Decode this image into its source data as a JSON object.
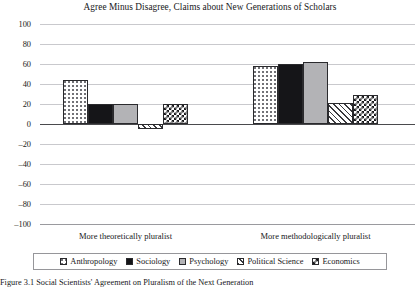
{
  "chart_data": {
    "type": "bar",
    "title": "Agree Minus Disagree, Claims about New Generations of Scholars",
    "xlabel": "",
    "ylabel": "",
    "categories": [
      "More theoretically pluralist",
      "More methodologically pluralist"
    ],
    "series": [
      {
        "name": "Anthropology",
        "values": [
          44,
          58
        ],
        "pattern": "dots"
      },
      {
        "name": "Sociology",
        "values": [
          20,
          60
        ],
        "pattern": "solid-black"
      },
      {
        "name": "Psychology",
        "values": [
          20,
          62
        ],
        "pattern": "solid-gray"
      },
      {
        "name": "Political Science",
        "values": [
          -5,
          21
        ],
        "pattern": "diagonal"
      },
      {
        "name": "Economics",
        "values": [
          20,
          29
        ],
        "pattern": "checker"
      }
    ],
    "ylim": [
      -100,
      100
    ],
    "yticks": [
      100,
      80,
      60,
      40,
      20,
      0,
      "–20",
      "–40",
      "–60",
      "–80",
      "–100"
    ],
    "ytick_values": [
      100,
      80,
      60,
      40,
      20,
      0,
      -20,
      -40,
      -60,
      -80,
      -100
    ],
    "grid": true,
    "legend_position": "bottom"
  },
  "caption": {
    "text": "Figure 3.1 Social Scientists' Agreement on Pluralism of the Next Generation"
  },
  "colors": {
    "gridline": "#c9c9cd",
    "zero_line": "#4a4a4d",
    "bar_edge": "#2a2a2d",
    "text": "#17171a",
    "legend_border": "#96969a"
  }
}
